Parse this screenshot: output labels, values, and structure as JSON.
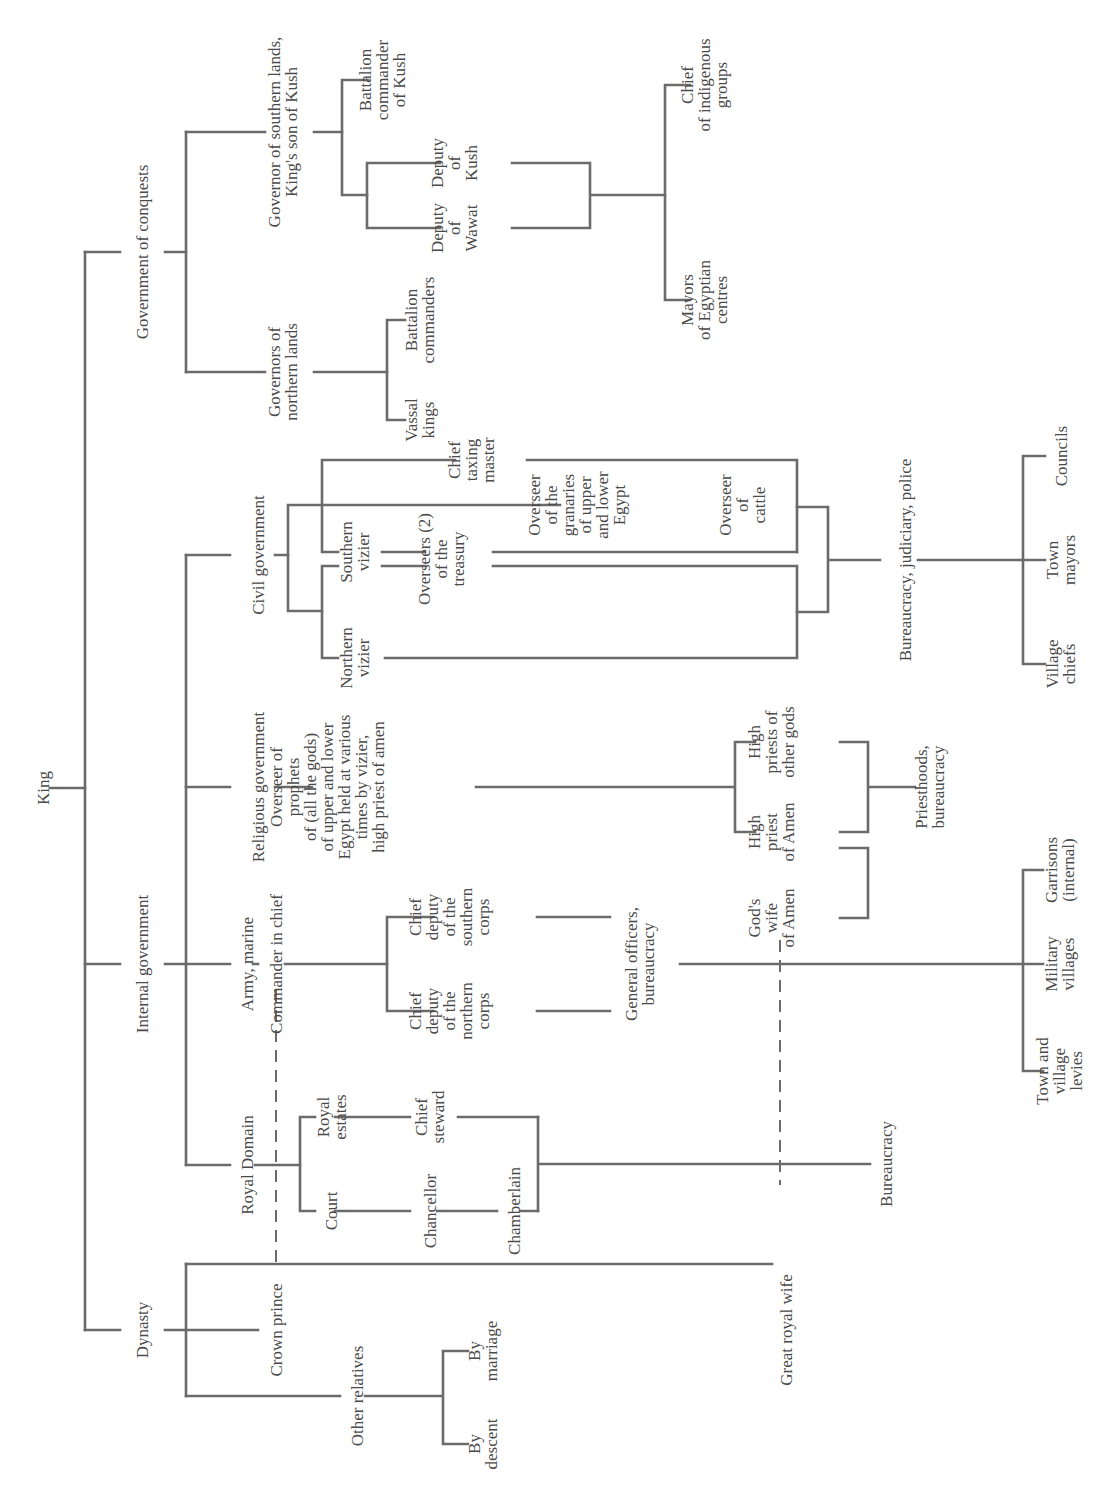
{
  "diagram": {
    "orientation": "rotated-90-ccw",
    "line_color": "#6b6b6b",
    "text_color": "#4a4a4a",
    "root": {
      "label": "King"
    },
    "branches": {
      "conquests": {
        "label": "Government of conquests",
        "southern": {
          "label": [
            "Governor of southern lands,",
            "King's son of Kush"
          ],
          "battalion_kush": [
            "Battalion",
            "commander",
            "of Kush"
          ],
          "deputy_kush": [
            "Deputy",
            "of",
            "Kush"
          ],
          "deputy_wawat": [
            "Deputy",
            "of",
            "Wawat"
          ],
          "chief_indigenous": [
            "Chief",
            "of indigenous",
            "groups"
          ],
          "mayors_egyptian": [
            "Mayors",
            "of Egyptian",
            "centres"
          ]
        },
        "northern": {
          "label": [
            "Governors of",
            "northern lands"
          ],
          "battalion": [
            "Battalion",
            "commanders"
          ],
          "vassal": [
            "Vassal",
            "kings"
          ]
        }
      },
      "internal": {
        "label": "Internal government",
        "civil": {
          "label": "Civil government",
          "chief_taxing": [
            "Chief",
            "taxing",
            "master"
          ],
          "southern_vizier": [
            "Southern",
            "vizier"
          ],
          "northern_vizier": [
            "Northern",
            "vizier"
          ],
          "treasury": [
            "Overseers (2)",
            "of the",
            "treasury"
          ],
          "granaries": [
            "Overseer",
            "of the",
            "granaries",
            "of upper",
            "and lower",
            "Egypt"
          ],
          "cattle": [
            "Overseer",
            "of",
            "cattle"
          ],
          "bureaucracy": "Bureaucracy, judiciary, police",
          "councils": "Councils",
          "town_mayors": [
            "Town",
            "mayors"
          ],
          "village_chiefs": [
            "Village",
            "chiefs"
          ]
        },
        "religious": {
          "label": "Religious government",
          "overseer": [
            "Overseer of",
            "prophets",
            "of (all the gods)",
            "of upper and lower",
            "Egypt held at various",
            "times by vizier,",
            "high priest of amen"
          ],
          "hp_other": [
            "High",
            "priests of",
            "other gods"
          ],
          "hp_amen": [
            "High",
            "priest",
            "of Amen"
          ],
          "gods_wife": [
            "God's",
            "wife",
            "of Amen"
          ],
          "priesthoods": [
            "Priesthoods,",
            "bureaucracy"
          ]
        },
        "army": {
          "label": "Army, marine",
          "commander": "Commander in chief",
          "deputy_southern": [
            "Chief",
            "deputy",
            "of the",
            "southern",
            "corps"
          ],
          "deputy_northern": [
            "Chief",
            "deputy",
            "of the",
            "northern",
            "corps"
          ],
          "general": [
            "General officers,",
            "bureaucracy"
          ],
          "garrisons": [
            "Garrisons",
            "(internal)"
          ],
          "military_villages": [
            "Military",
            "villages"
          ],
          "levies": [
            "Town and",
            "village",
            "levies"
          ]
        },
        "royal_domain": {
          "label": "Royal Domain",
          "estates": [
            "Royal",
            "estates"
          ],
          "court": "Court",
          "chief_steward": [
            "Chief",
            "steward"
          ],
          "chancellor": "Chancellor",
          "chamberlain": "Chamberlain",
          "bureaucracy": "Bureaucracy"
        }
      },
      "dynasty": {
        "label": "Dynasty",
        "crown_prince": "Crown prince",
        "great_royal_wife": "Great royal wife",
        "other_relatives": "Other relatives",
        "by_marriage": [
          "By",
          "marriage"
        ],
        "by_descent": [
          "By",
          "descent"
        ]
      }
    }
  }
}
